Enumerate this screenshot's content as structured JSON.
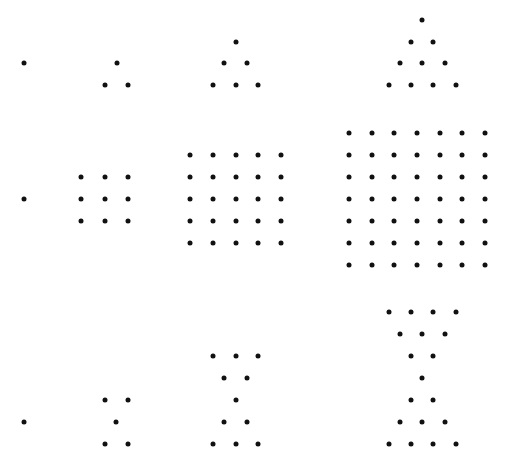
{
  "diagram": {
    "type": "figurate-number-dot-patterns",
    "dot_color": "#111111",
    "background": "#ffffff",
    "rows": [
      {
        "name": "triangular",
        "counts": [
          1,
          3,
          6,
          10
        ],
        "figures": [
          {
            "dots": [
              [
                24,
                63
              ]
            ]
          },
          {
            "dots": [
              [
                117,
                63
              ],
              [
                105,
                85
              ],
              [
                128,
                85
              ]
            ]
          },
          {
            "dots": [
              [
                236,
                42
              ],
              [
                224,
                63
              ],
              [
                247,
                63
              ],
              [
                213,
                85
              ],
              [
                236,
                85
              ],
              [
                258,
                85
              ]
            ]
          },
          {
            "dots": [
              [
                422,
                20
              ],
              [
                411,
                42
              ],
              [
                433,
                42
              ],
              [
                400,
                63
              ],
              [
                422,
                63
              ],
              [
                445,
                63
              ],
              [
                389,
                85
              ],
              [
                411,
                85
              ],
              [
                433,
                85
              ],
              [
                456,
                85
              ]
            ]
          }
        ]
      },
      {
        "name": "square",
        "counts": [
          1,
          9,
          25,
          49
        ],
        "figures": [
          {
            "grid": {
              "cols": [
                24
              ],
              "rows": [
                199
              ]
            }
          },
          {
            "grid": {
              "cols": [
                81,
                105,
                128
              ],
              "rows": [
                177,
                199,
                221
              ]
            }
          },
          {
            "grid": {
              "cols": [
                190,
                213,
                236,
                258,
                281
              ],
              "rows": [
                155,
                177,
                199,
                221,
                243
              ]
            }
          },
          {
            "grid": {
              "cols": [
                349,
                372,
                394,
                417,
                440,
                462,
                485
              ],
              "rows": [
                133,
                155,
                177,
                199,
                221,
                243,
                265
              ]
            }
          }
        ]
      },
      {
        "name": "hourglass",
        "counts": [
          1,
          5,
          11,
          19
        ],
        "figures": [
          {
            "dots": [
              [
                24,
                422
              ]
            ]
          },
          {
            "dots": [
              [
                105,
                400
              ],
              [
                128,
                400
              ],
              [
                116,
                422
              ],
              [
                105,
                444
              ],
              [
                128,
                444
              ]
            ]
          },
          {
            "dots": [
              [
                213,
                356
              ],
              [
                236,
                356
              ],
              [
                258,
                356
              ],
              [
                224,
                378
              ],
              [
                247,
                378
              ],
              [
                236,
                400
              ],
              [
                224,
                422
              ],
              [
                247,
                422
              ],
              [
                213,
                444
              ],
              [
                236,
                444
              ],
              [
                258,
                444
              ]
            ]
          },
          {
            "dots": [
              [
                389,
                312
              ],
              [
                411,
                312
              ],
              [
                433,
                312
              ],
              [
                456,
                312
              ],
              [
                400,
                334
              ],
              [
                422,
                334
              ],
              [
                445,
                334
              ],
              [
                411,
                356
              ],
              [
                433,
                356
              ],
              [
                422,
                378
              ],
              [
                411,
                400
              ],
              [
                433,
                400
              ],
              [
                400,
                422
              ],
              [
                422,
                422
              ],
              [
                445,
                422
              ],
              [
                389,
                444
              ],
              [
                411,
                444
              ],
              [
                433,
                444
              ],
              [
                456,
                444
              ]
            ]
          }
        ]
      }
    ]
  }
}
